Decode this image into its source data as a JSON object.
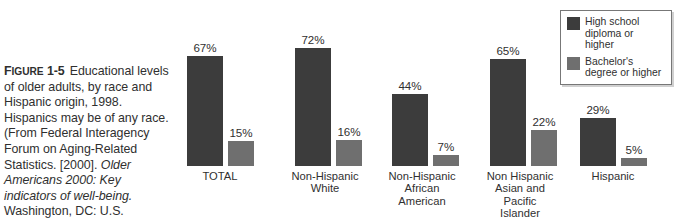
{
  "caption": {
    "figure_label": "Figure 1-5",
    "figure_label_prefix": "F",
    "figure_label_smallcaps": "IGURE",
    "figure_label_number": "1-5",
    "body_part1": "Educational levels of older adults, by race and Hispanic origin, 1998. Hispanics may be of any race. (From Federal Interagency Forum on Aging-Related Statistics. [2000].",
    "body_italic": "Older Americans 2000: Key indicators of well-being.",
    "body_part2": "Washington, DC: U.S. Government Printing Office.)"
  },
  "legend": {
    "position": "top-right",
    "items": [
      {
        "label": "High school diploma or higher",
        "color": "#3c3c3c",
        "swatch": "dark-swatch"
      },
      {
        "label": "Bachelor's degree or higher",
        "color": "#6f6f6f",
        "swatch": "light-swatch"
      }
    ]
  },
  "chart_data": {
    "type": "bar",
    "title": "Educational levels of older adults, by race and Hispanic origin, 1998",
    "xlabel": "",
    "ylabel": "Percent",
    "ylim": [
      0,
      80
    ],
    "grid": false,
    "legend_position": "top-right",
    "categories": [
      "TOTAL",
      "Non-Hispanic White",
      "Non-Hispanic African American",
      "Non Hispanic Asian and Pacific Islander",
      "Hispanic"
    ],
    "category_lines": [
      [
        "TOTAL"
      ],
      [
        "Non-Hispanic",
        "White"
      ],
      [
        "Non-Hispanic",
        "African",
        "American"
      ],
      [
        "Non Hispanic",
        "Asian and",
        "Pacific",
        "Islander"
      ],
      [
        "Hispanic"
      ]
    ],
    "series": [
      {
        "name": "High school diploma or higher",
        "color": "#3c3c3c",
        "values": [
          67,
          72,
          44,
          65,
          29
        ],
        "labels": [
          "67%",
          "72%",
          "44%",
          "65%",
          "29%"
        ]
      },
      {
        "name": "Bachelor's degree or higher",
        "color": "#6f6f6f",
        "values": [
          15,
          16,
          7,
          22,
          5
        ],
        "labels": [
          "15%",
          "16%",
          "7%",
          "22%",
          "5%"
        ]
      }
    ]
  }
}
